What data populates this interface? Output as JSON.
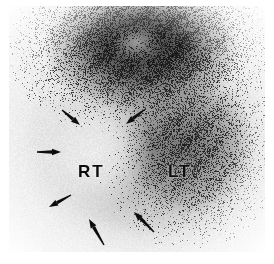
{
  "figure": {
    "modality": "nuclear-medicine-scintigram",
    "background_color": "#ffffff",
    "plate_color": "#f2f2f2",
    "arrow_color": "#0d0d0d",
    "label_color": "#0d0d0d"
  },
  "labels": {
    "right_side": "RT",
    "left_side": "LT"
  },
  "annotations": {
    "arrows": [
      {
        "id": "arrow-1",
        "x1": 62,
        "y1": 110,
        "x2": 80,
        "y2": 125,
        "direction": "down-right"
      },
      {
        "id": "arrow-2",
        "x1": 37,
        "y1": 152,
        "x2": 61,
        "y2": 152,
        "direction": "right"
      },
      {
        "id": "arrow-3",
        "x1": 144,
        "y1": 110,
        "x2": 126,
        "y2": 124,
        "direction": "down-left"
      },
      {
        "id": "arrow-4",
        "x1": 71,
        "y1": 195,
        "x2": 49,
        "y2": 207,
        "direction": "up-left-tail"
      },
      {
        "id": "arrow-5",
        "x1": 104,
        "y1": 245,
        "x2": 89,
        "y2": 219,
        "direction": "up-left"
      },
      {
        "id": "arrow-6",
        "x1": 154,
        "y1": 232,
        "x2": 134,
        "y2": 212,
        "direction": "up-left"
      }
    ],
    "arrow_count": 6
  },
  "chart_data": {
    "type": "heatmap",
    "title": "",
    "xlabel": "",
    "ylabel": "",
    "regions": [
      {
        "name": "superior-uptake",
        "cx_pct": 52,
        "cy_pct": 17,
        "rx_pct": 42,
        "ry_pct": 30,
        "intensity": 0.88
      },
      {
        "name": "lt-activity",
        "cx_pct": 70,
        "cy_pct": 56,
        "rx_pct": 30,
        "ry_pct": 34,
        "intensity": 0.55
      },
      {
        "name": "rt-photopenic-defect",
        "cx_pct": 33,
        "cy_pct": 59,
        "rx_pct": 25,
        "ry_pct": 27,
        "intensity": 0.05
      },
      {
        "name": "central-core-lucency",
        "cx_pct": 50,
        "cy_pct": 15,
        "rx_pct": 13,
        "ry_pct": 10,
        "intensity": 0.3
      }
    ],
    "intensity_range": [
      0,
      1
    ],
    "grid": false,
    "legend": "none"
  }
}
